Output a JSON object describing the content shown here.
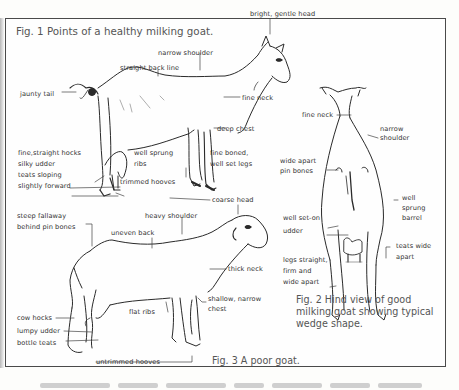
{
  "figures": {
    "fig1": {
      "caption": "Fig. 1  Points of a healthy milking goat.",
      "labels": {
        "bright_gentle_head": "bright, gentle head",
        "narrow_shoulder": "narrow shoulder",
        "straight_back_line": "straight back  line",
        "jaunty_tail": "jaunty tail",
        "fine_neck": "fine neck",
        "deep_chest": "deep chest",
        "fine_straight_hocks": "fine,straight hocks",
        "silky_udder": "silky udder",
        "teats_sloping": "teats sloping",
        "slightly_forward": "slightly forward",
        "well_sprung": "well sprung",
        "ribs": "ribs",
        "fine_boned": "fine boned,",
        "well_set_legs": "well set legs",
        "trimmed_hooves": "trimmed hooves"
      }
    },
    "fig2": {
      "caption_lines": [
        "Fig. 2  Hind view of good",
        "milking goat showing typical",
        "wedge shape."
      ],
      "labels": {
        "fine_neck": "fine neck",
        "narrow": "narrow",
        "shoulder": "shoulder",
        "wide_apart": "wide apart",
        "pin_bones": "pin bones",
        "well": "well",
        "sprung": "sprung",
        "barrel": "barrel",
        "well_set_on": "well set-on",
        "udder": "udder",
        "legs_straight": "legs straight,",
        "firm_and": "firm and",
        "wide_apart_legs": "wide apart",
        "teats_wide": "teats wide",
        "apart": "apart"
      }
    },
    "fig3": {
      "caption": "Fig. 3  A poor goat.",
      "labels": {
        "coarse_head": "coarse head",
        "steep_fallaway": "steep fallaway",
        "behind_pin_bones": "behind pin bones",
        "heavy_shoulder": "heavy shoulder",
        "uneven_back": "uneven back",
        "thick_neck": "thick neck",
        "shallow_narrow": "shallow, narrow",
        "chest": "chest",
        "flat_ribs": "flat ribs",
        "cow_hocks": "cow hocks",
        "lumpy_udder": "lumpy udder",
        "bottle_teats": "bottle teats",
        "untrimmed_hooves": "untrimmed hooves"
      }
    }
  },
  "colors": {
    "ink": "#2a2a2a",
    "caption": "#555555",
    "border": "#4a4a4a",
    "paper": "#fefefe"
  }
}
